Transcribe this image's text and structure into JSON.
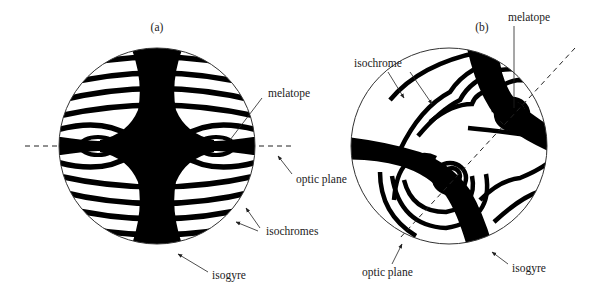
{
  "figure": {
    "panels": [
      {
        "id": "a",
        "label": "(a)",
        "annotations": {
          "melatope": "melatope",
          "optic_plane": "optic plane",
          "isochromes": "isochromes",
          "isogyre": "isogyre"
        }
      },
      {
        "id": "b",
        "label": "(b)",
        "annotations": {
          "melatope": "melatope",
          "isochrome": "isochrome",
          "optic_plane": "optic plane",
          "isogyre": "isogyre"
        }
      }
    ],
    "colors": {
      "ink": "#000000",
      "background": "#ffffff",
      "text": "#222222"
    }
  }
}
